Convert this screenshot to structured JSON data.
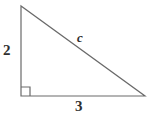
{
  "figure": {
    "type": "right-triangle-diagram",
    "background_color": "#ffffff",
    "stroke_color": "#6a6a6a",
    "label_color": "#2f2f2f"
  },
  "geometry": {
    "vertices": {
      "top_left": [
        21,
        6
      ],
      "bottom_left": [
        21,
        96
      ],
      "bottom_right": [
        145,
        96
      ]
    },
    "right_angle_marker": {
      "vertex": "bottom_left",
      "size": 9
    }
  },
  "labels": {
    "vertical_leg": "2",
    "horizontal_leg": "3",
    "hypotenuse": "c"
  }
}
